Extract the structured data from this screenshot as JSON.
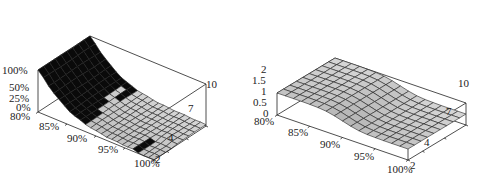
{
  "chart_data": [
    {
      "type": "surface3d",
      "title": "",
      "xlabel": "",
      "ylabel": "",
      "zlabel": "",
      "x_ticks": [
        "80%",
        "85%",
        "90%",
        "95%",
        "100%"
      ],
      "y_ticks": [
        "2",
        "4",
        "7",
        "10"
      ],
      "z_ticks": [
        "0%",
        "25%",
        "50%",
        "100%"
      ],
      "x_range": [
        80,
        100
      ],
      "y_range": [
        2,
        10
      ],
      "z_range": [
        0,
        100
      ],
      "description": "Surface high (~100%) near x=80% falling steeply to ~0-10% around x=88-92%, staying low toward x=100%; dark-shaded steep front face on left side, light grey mesh elsewhere; slight dip near x=100%, y=2-4.",
      "x": [
        80,
        82,
        84,
        86,
        88,
        90,
        92,
        94,
        96,
        98,
        100
      ],
      "y": [
        2,
        3,
        4,
        5,
        6,
        7,
        8,
        9,
        10
      ],
      "z_profile_along_x": [
        100,
        70,
        45,
        28,
        18,
        12,
        8,
        6,
        5,
        4,
        3
      ]
    },
    {
      "type": "surface3d",
      "title": "",
      "xlabel": "",
      "ylabel": "",
      "zlabel": "",
      "x_ticks": [
        "80%",
        "85%",
        "90%",
        "95%",
        "100%"
      ],
      "y_ticks": [
        "2",
        "4",
        "7",
        "10"
      ],
      "z_ticks": [
        "0",
        "0.5",
        "1",
        "1.5",
        "2"
      ],
      "x_range": [
        80,
        100
      ],
      "y_range": [
        2,
        10
      ],
      "z_range": [
        0,
        2
      ],
      "description": "Surface plateau at ~2 for x from 80% to ~88%, smooth sigmoid drop to ~1 around x=90-93%, then flat at ~1 toward x=100%; constant along y.",
      "x": [
        80,
        82,
        84,
        86,
        88,
        90,
        92,
        94,
        96,
        98,
        100
      ],
      "y": [
        2,
        3,
        4,
        5,
        6,
        7,
        8,
        9,
        10
      ],
      "z_profile_along_x": [
        2.0,
        2.0,
        2.0,
        1.98,
        1.85,
        1.5,
        1.15,
        1.02,
        1.0,
        1.0,
        1.0
      ]
    }
  ],
  "plots": {
    "left": {
      "z_tick_labels": [
        "100%",
        "50%",
        "25%",
        "0%"
      ],
      "x_tick_labels": [
        "80%",
        "85%",
        "90%",
        "95%",
        "100%"
      ],
      "y_tick_labels": [
        "2",
        "4",
        "7",
        "10"
      ]
    },
    "right": {
      "z_tick_labels": [
        "2",
        "1.5",
        "1",
        "0.5",
        "0"
      ],
      "x_tick_labels": [
        "80%",
        "85%",
        "90%",
        "95%",
        "100%"
      ],
      "y_tick_labels": [
        "2",
        "4",
        "7",
        "10"
      ]
    }
  },
  "colors": {
    "mesh_fill": "#c8c8c8",
    "mesh_line": "#222222",
    "dark_face": "#0a0a0a",
    "box_line": "#222222"
  }
}
